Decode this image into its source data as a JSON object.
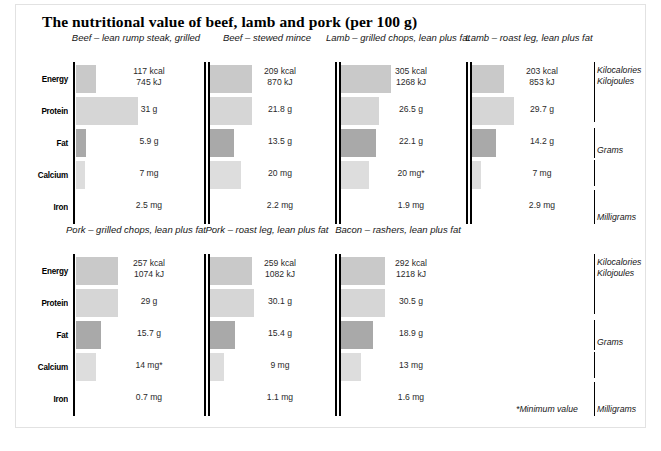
{
  "title": "The nutritional value of beef, lamb and pork (per 100 g)",
  "footnote": "*Minimum value",
  "row_labels": [
    "Energy",
    "Protein",
    "Fat",
    "Calcium",
    "Iron"
  ],
  "unit_labels": {
    "energy": "Kilocalories\nKilojoules",
    "grams": "Grams",
    "milligrams": "Milligrams"
  },
  "colors": {
    "energy_bar": "#c9c9c9",
    "protein_bar": "#d6d6d6",
    "fat_bar": "#a9a9a9",
    "calcium_bar": "#dddddd",
    "iron_bar": "#ffffff",
    "axis": "#000000",
    "frame": "#e2e2e2"
  },
  "chart_data": {
    "type": "bar",
    "title": "The nutritional value of beef, lamb and pork (per 100 g)",
    "xlabel": "",
    "ylabel": "",
    "grid": false,
    "legend": "none",
    "note": "*Minimum value",
    "categories": [
      "Energy",
      "Protein",
      "Fat",
      "Calcium",
      "Iron"
    ],
    "units": [
      "Kilocalories / Kilojoules",
      "Grams",
      "Grams",
      "Milligrams",
      "Milligrams"
    ],
    "series": [
      {
        "name": "Beef – lean rump steak, grilled",
        "panel": 0,
        "axis_break": false,
        "values": [
          {
            "row": "Energy",
            "label": "117 kcal\n745 kJ",
            "kcal": 117,
            "kj": 745,
            "bar": 20
          },
          {
            "row": "Protein",
            "label": "31 g",
            "value": 31,
            "bar": 62
          },
          {
            "row": "Fat",
            "label": "5.9 g",
            "value": 5.9,
            "bar": 10
          },
          {
            "row": "Calcium",
            "label": "7 mg",
            "value": 7,
            "bar": 9
          },
          {
            "row": "Iron",
            "label": "2.5 mg",
            "value": 2.5,
            "bar": 0
          }
        ]
      },
      {
        "name": "Beef – stewed mince",
        "panel": 0,
        "axis_break": true,
        "values": [
          {
            "row": "Energy",
            "label": "209 kcal\n870 kJ",
            "kcal": 209,
            "kj": 870,
            "bar": 42
          },
          {
            "row": "Protein",
            "label": "21.8 g",
            "value": 21.8,
            "bar": 42
          },
          {
            "row": "Fat",
            "label": "13.5 g",
            "value": 13.5,
            "bar": 24
          },
          {
            "row": "Calcium",
            "label": "20 mg",
            "value": 20,
            "bar": 31
          },
          {
            "row": "Iron",
            "label": "2.2 mg",
            "value": 2.2,
            "bar": 0
          }
        ]
      },
      {
        "name": "Lamb – grilled chops, lean plus fat",
        "panel": 0,
        "axis_break": true,
        "values": [
          {
            "row": "Energy",
            "label": "305 kcal\n1268 kJ",
            "kcal": 305,
            "kj": 1268,
            "bar": 50
          },
          {
            "row": "Protein",
            "label": "26.5 g",
            "value": 26.5,
            "bar": 38
          },
          {
            "row": "Fat",
            "label": "22.1 g",
            "value": 22.1,
            "bar": 35
          },
          {
            "row": "Calcium",
            "label": "20 mg*",
            "value": 20,
            "bar": 28
          },
          {
            "row": "Iron",
            "label": "1.9 mg",
            "value": 1.9,
            "bar": 0
          }
        ]
      },
      {
        "name": "Lamb – roast leg, lean plus fat",
        "panel": 0,
        "axis_break": true,
        "values": [
          {
            "row": "Energy",
            "label": "203 kcal\n853 kJ",
            "kcal": 203,
            "kj": 853,
            "bar": 32
          },
          {
            "row": "Protein",
            "label": "29.7 g",
            "value": 29.7,
            "bar": 42
          },
          {
            "row": "Fat",
            "label": "14.2 g",
            "value": 14.2,
            "bar": 24
          },
          {
            "row": "Calcium",
            "label": "7 mg",
            "value": 7,
            "bar": 9
          },
          {
            "row": "Iron",
            "label": "2.9 mg",
            "value": 2.9,
            "bar": 0
          }
        ]
      },
      {
        "name": "Pork – grilled chops, lean plus fat",
        "panel": 1,
        "axis_break": false,
        "values": [
          {
            "row": "Energy",
            "label": "257 kcal\n1074 kJ",
            "kcal": 257,
            "kj": 1074,
            "bar": 42
          },
          {
            "row": "Protein",
            "label": "29 g",
            "value": 29,
            "bar": 42
          },
          {
            "row": "Fat",
            "label": "15.7 g",
            "value": 15.7,
            "bar": 25
          },
          {
            "row": "Calcium",
            "label": "14 mg*",
            "value": 14,
            "bar": 20
          },
          {
            "row": "Iron",
            "label": "0.7 mg",
            "value": 0.7,
            "bar": 0
          }
        ]
      },
      {
        "name": "Pork – roast leg, lean plus fat",
        "panel": 1,
        "axis_break": true,
        "values": [
          {
            "row": "Energy",
            "label": "259 kcal\n1082 kJ",
            "kcal": 259,
            "kj": 1082,
            "bar": 42
          },
          {
            "row": "Protein",
            "label": "30.1 g",
            "value": 30.1,
            "bar": 44
          },
          {
            "row": "Fat",
            "label": "15.4 g",
            "value": 15.4,
            "bar": 25
          },
          {
            "row": "Calcium",
            "label": "9 mg",
            "value": 9,
            "bar": 14
          },
          {
            "row": "Iron",
            "label": "1.1 mg",
            "value": 1.1,
            "bar": 0
          }
        ]
      },
      {
        "name": "Bacon – rashers, lean plus fat",
        "panel": 1,
        "axis_break": true,
        "values": [
          {
            "row": "Energy",
            "label": "292 kcal\n1218 kJ",
            "kcal": 292,
            "kj": 1218,
            "bar": 44
          },
          {
            "row": "Protein",
            "label": "30.5 g",
            "value": 30.5,
            "bar": 44
          },
          {
            "row": "Fat",
            "label": "18.9 g",
            "value": 18.9,
            "bar": 32
          },
          {
            "row": "Calcium",
            "label": "13 mg",
            "value": 13,
            "bar": 20
          },
          {
            "row": "Iron",
            "label": "1.6 mg",
            "value": 1.6,
            "bar": 0
          }
        ]
      }
    ]
  }
}
